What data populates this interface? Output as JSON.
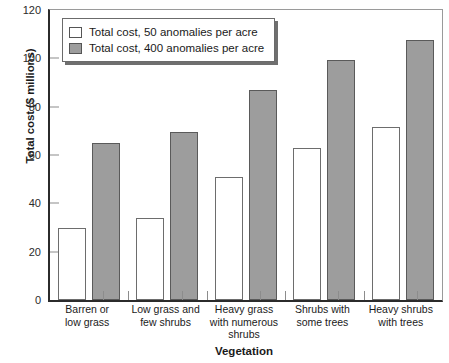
{
  "chart_data": {
    "type": "bar",
    "title": "",
    "xlabel": "Vegetation",
    "ylabel": "Total cost ($ millions)",
    "ylim": [
      0,
      120
    ],
    "yticks": [
      0,
      20,
      40,
      60,
      80,
      100,
      120
    ],
    "ytick_labels": [
      "0",
      "20",
      "40",
      "60",
      "80",
      "100",
      "120"
    ],
    "grid": false,
    "legend_position": "upper left",
    "categories": [
      "Barren or low grass",
      "Low grass and few shrubs",
      "Heavy grass with numerous shrubs",
      "Shrubs with some trees",
      "Heavy shrubs with trees"
    ],
    "category_lines": [
      [
        "Barren or",
        "low grass"
      ],
      [
        "Low grass and",
        "few shrubs"
      ],
      [
        "Heavy grass",
        "with numerous",
        "shrubs"
      ],
      [
        "Shrubs with",
        "some trees"
      ],
      [
        "Heavy shrubs",
        "with trees"
      ]
    ],
    "series": [
      {
        "name": "Total cost, 50 anomalies per acre",
        "color": "#ffffff",
        "values": [
          30,
          34,
          51,
          63,
          71.5
        ]
      },
      {
        "name": "Total cost, 400 anomalies per acre",
        "color": "#9d9d9d",
        "values": [
          65,
          69.5,
          87,
          99.5,
          107.5
        ]
      }
    ]
  },
  "legend": {
    "items": [
      {
        "label": "Total cost, 50 anomalies per acre",
        "swatch": "white-square-icon"
      },
      {
        "label": "Total cost, 400 anomalies per acre",
        "swatch": "gray-square-icon"
      }
    ]
  }
}
